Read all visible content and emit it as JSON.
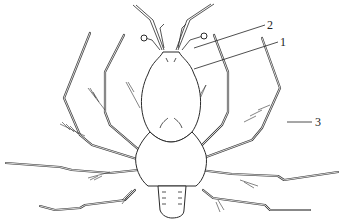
{
  "figure": {
    "labels": [
      {
        "id": "1",
        "text": "1"
      },
      {
        "id": "2",
        "text": "2"
      },
      {
        "id": "3",
        "text": "3"
      }
    ],
    "colors": {
      "line": "#2a2a2a",
      "background": "#ffffff"
    }
  }
}
